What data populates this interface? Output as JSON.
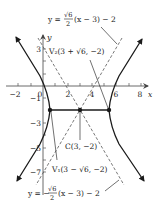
{
  "figure": {
    "type": "hyperbola-graph",
    "equation_center": "C(3, −2)",
    "axes": {
      "x_label": "x",
      "y_label": "y",
      "x_ticks": [
        "−2",
        "0",
        "2",
        "4",
        "6",
        "8"
      ],
      "y_ticks": [
        "3",
        "−1",
        "−3",
        "−5",
        "−7"
      ]
    },
    "labels": {
      "asymptote_top": {
        "prefix": "y =",
        "sqrt": "√6",
        "den": "2",
        "suffix": "(x − 3) − 2"
      },
      "asymptote_bottom": {
        "prefix": "y = −",
        "sqrt": "√6",
        "den": "2",
        "suffix": "(x − 3) − 2"
      },
      "vertex_2": "V₂(3 + √6, −2)",
      "vertex_1": "V₁(3 − √6, −2)",
      "center": "C(3, −2)"
    },
    "points": [
      {
        "name": "V1",
        "x": 0.55,
        "y": -2
      },
      {
        "name": "C",
        "x": 3,
        "y": -2
      },
      {
        "name": "V2",
        "x": 5.45,
        "y": -2
      }
    ],
    "colors": {
      "curve": "#1a1a1a",
      "asymptote": "#555555",
      "axis": "#444444",
      "text": "#222222"
    }
  }
}
